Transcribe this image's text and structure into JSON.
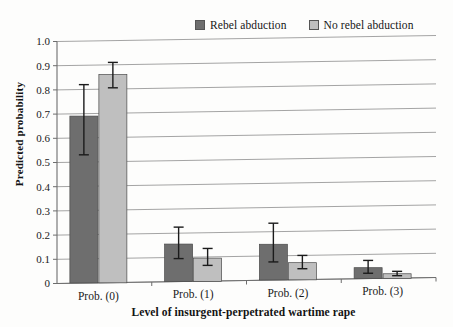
{
  "chart_data": {
    "type": "bar",
    "title": "",
    "xlabel": "Level of insurgent-perpetrated wartime rape",
    "ylabel": "Predicted probability",
    "categories": [
      "Prob. (0)",
      "Prob. (1)",
      "Prob. (2)",
      "Prob. (3)"
    ],
    "ylim": [
      0,
      1.0
    ],
    "ytick_labels": [
      "0",
      "0.1",
      "0.2",
      "0.3",
      "0.4",
      "0.5",
      "0.6",
      "0.7",
      "0.8",
      "0.9",
      "1.0"
    ],
    "ytick_values": [
      0,
      0.1,
      0.2,
      0.3,
      0.4,
      0.5,
      0.6,
      0.7,
      0.8,
      0.9,
      1.0
    ],
    "grid": true,
    "legend_position": "top-right",
    "series": [
      {
        "name": "Rebel abduction",
        "color": "#6e6e6e",
        "values": [
          0.69,
          0.155,
          0.148,
          0.045
        ],
        "error_low": [
          0.53,
          0.095,
          0.075,
          0.022
        ],
        "error_high": [
          0.82,
          0.225,
          0.235,
          0.075
        ]
      },
      {
        "name": "No rebel abduction",
        "color": "#bfbfbf",
        "values": [
          0.86,
          0.095,
          0.07,
          0.018
        ],
        "error_low": [
          0.805,
          0.065,
          0.045,
          0.01
        ],
        "error_high": [
          0.91,
          0.135,
          0.1,
          0.028
        ]
      }
    ]
  },
  "legend": {
    "entries": [
      {
        "label": "Rebel abduction",
        "color": "#6e6e6e"
      },
      {
        "label": "No rebel abduction",
        "color": "#bfbfbf"
      }
    ]
  },
  "axes": {
    "y_title": "Predicted probability",
    "x_title": "Level of insurgent-perpetrated wartime rape"
  }
}
